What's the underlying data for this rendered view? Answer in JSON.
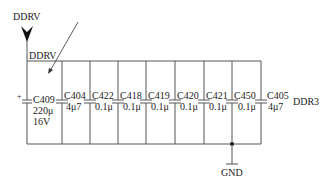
{
  "diagram": {
    "type": "circuit-schematic",
    "power_port": {
      "label": "DDRV",
      "x": 27
    },
    "net_label": "DDRV",
    "rail_label": "DDR3",
    "ground_label": "GND",
    "colors": {
      "wire": "#555555",
      "text": "#222222",
      "background": "#ffffff"
    },
    "capacitors": [
      {
        "ref": "C409",
        "value": "220μ",
        "rating": "16V",
        "polarized": true,
        "x": 27
      },
      {
        "ref": "C404",
        "value": "4μ7",
        "x": 62
      },
      {
        "ref": "C422",
        "value": "0.1μ",
        "x": 90
      },
      {
        "ref": "C418",
        "value": "0.1μ",
        "x": 118
      },
      {
        "ref": "C419",
        "value": "0.1μ",
        "x": 146
      },
      {
        "ref": "C420",
        "value": "0.1μ",
        "x": 175
      },
      {
        "ref": "C421",
        "value": "0.1μ",
        "x": 204
      },
      {
        "ref": "C450",
        "value": "0.1μ",
        "x": 232
      },
      {
        "ref": "C405",
        "value": "4μ7",
        "x": 261
      }
    ]
  }
}
